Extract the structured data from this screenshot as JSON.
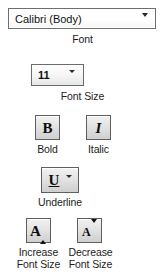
{
  "figure": {
    "background_color": "#ffffff",
    "text_color": "#1c1c1c"
  },
  "controls": {
    "font_name": {
      "label": "Font",
      "value": "Calibri (Body)",
      "placeholder": "Calibri (Body)",
      "dropdown_icon": "chevron-down-icon"
    },
    "font_size": {
      "label": "Font Size",
      "value": "11",
      "placeholder": "11",
      "dropdown_icon": "chevron-down-icon"
    },
    "bold": {
      "label": "Bold",
      "glyph": "B",
      "icon": "bold-icon"
    },
    "italic": {
      "label": "Italic",
      "glyph": "I",
      "icon": "italic-icon"
    },
    "underline": {
      "label": "Underline",
      "glyph": "U",
      "icon": "underline-icon",
      "dropdown_icon": "chevron-down-icon"
    },
    "increase_font_size": {
      "label_line1": "Increase",
      "label_line2": "Font Size",
      "glyph": "A",
      "icon": "increase-font-size-icon",
      "arrow": "triangle-up-icon"
    },
    "decrease_font_size": {
      "label_line1": "Decrease",
      "label_line2": "Font Size",
      "glyph": "A",
      "icon": "decrease-font-size-icon",
      "arrow": "triangle-down-icon"
    }
  }
}
